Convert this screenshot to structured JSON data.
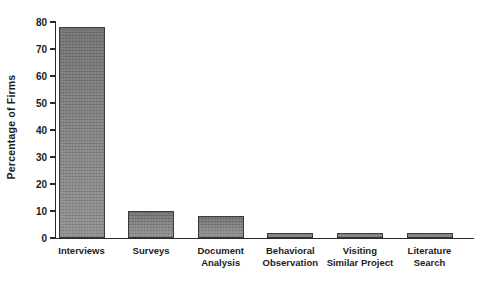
{
  "chart_data": {
    "type": "bar",
    "title": "",
    "xlabel": "",
    "ylabel": "Percentage of Firms",
    "categories": [
      "Interviews",
      "Surveys",
      "Document Analysis",
      "Behavioral Observation",
      "Visiting Similar Project",
      "Literature Search"
    ],
    "values": [
      78,
      10,
      8,
      2,
      2,
      2
    ],
    "ylim": [
      0,
      80
    ],
    "yticks": [
      0,
      10,
      20,
      30,
      40,
      50,
      60,
      70,
      80
    ],
    "grid": false,
    "legend_position": "none",
    "bar_color": "#8e8e8e",
    "bar_border_color": "#3a3a3a",
    "axis_color": "#2a2a2a",
    "background_color": "#ffffff"
  }
}
